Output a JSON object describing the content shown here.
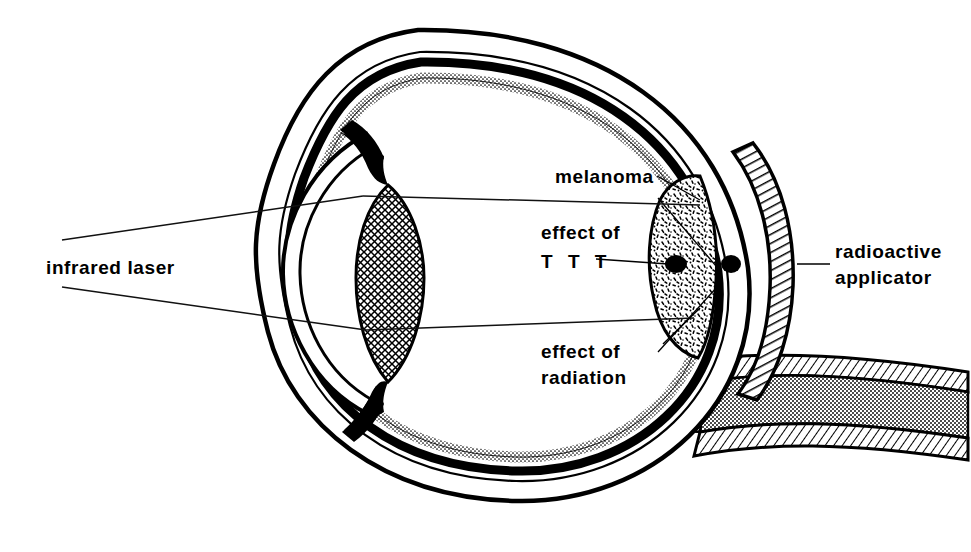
{
  "figure": {
    "background_color": "#ffffff",
    "ink_color": "#000000"
  },
  "labels": {
    "infrared_laser": "infrared laser",
    "melanoma": "melanoma",
    "effect_of": "effect of",
    "ttt": "T T T",
    "effect_of_2": "effect of",
    "radiation": "radiation",
    "radioactive": "radioactive",
    "applicator": "applicator"
  },
  "anatomy": {
    "cornea": "cornea",
    "lens": "lens",
    "iris": "iris",
    "sclera": "sclera",
    "choroid": "choroid",
    "retina": "retina",
    "optic_nerve": "optic-nerve",
    "vitreous": "vitreous-chamber",
    "anterior_chamber": "anterior-chamber"
  },
  "treatment": {
    "tumor": "choroidal-melanoma",
    "plaque": "radioactive-plaque-applicator",
    "ttt_spots": "transpupillary-thermotherapy-spots",
    "laser_beam": "infrared-laser-beam"
  }
}
